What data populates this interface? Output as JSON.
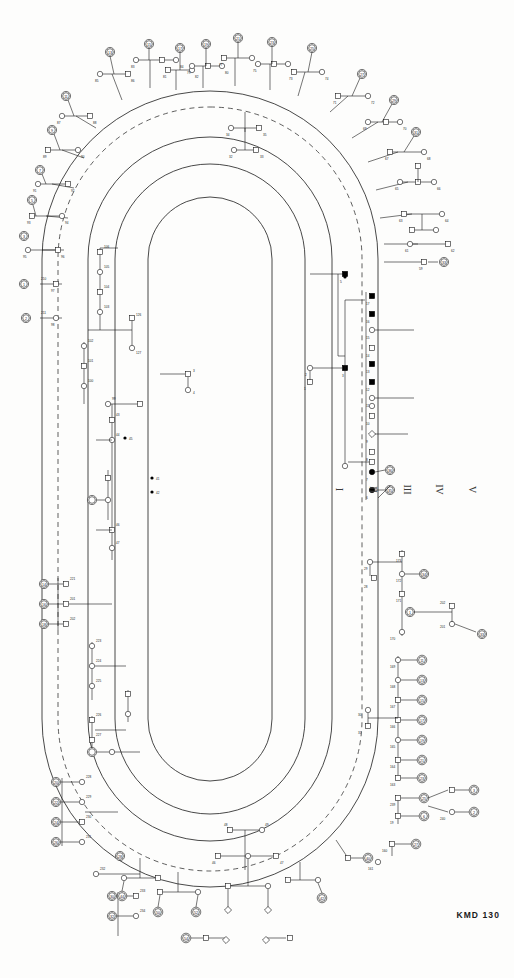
{
  "figure": {
    "identifier": "KMD 130",
    "type": "circular-pedigree-chart",
    "title": "",
    "background_color": "#fdfdfc",
    "line_color": "#1a1a1a",
    "affected_fill": "#000000"
  },
  "generation_legend": {
    "orientation": "rotated-90",
    "labels": [
      "I",
      "II",
      "III",
      "IV",
      "V"
    ],
    "x_positions": [
      338,
      372,
      405,
      437,
      470
    ],
    "y": 492
  },
  "tracks": {
    "description": "Concentric oval generation rings",
    "rings": [
      {
        "name": "outer-solid",
        "rx": 168,
        "ry": 398,
        "dash": "none"
      },
      {
        "name": "generation-dashed",
        "rx": 152,
        "ry": 382,
        "dash": "6 5"
      },
      {
        "name": "mid-solid-outer",
        "rx": 122,
        "ry": 352,
        "dash": "none"
      },
      {
        "name": "mid-solid-inner",
        "rx": 95,
        "ry": 325,
        "dash": "none"
      },
      {
        "name": "inner-solid",
        "rx": 62,
        "ry": 292,
        "dash": "none"
      }
    ],
    "center_x": 210,
    "center_y": 489
  },
  "symbols": {
    "male": "square",
    "female": "circle",
    "unknown_sex": "diamond",
    "affected": "filled-black",
    "unaffected": "open-white",
    "proband_marker": "double-outline-with-number"
  },
  "core_family": {
    "note": "Central affected sibship at right of inner oval",
    "affected_ids": [
      "63",
      "65",
      "39",
      "41",
      "38",
      "40"
    ],
    "members": [
      {
        "id": "37",
        "sex": "male",
        "affected": true
      },
      {
        "id": "36",
        "sex": "female",
        "affected": false
      },
      {
        "id": "68",
        "sex": "male",
        "affected": true
      },
      {
        "id": "69",
        "sex": "male",
        "affected": true
      },
      {
        "id": "63",
        "sex": "female",
        "affected": true
      },
      {
        "id": "65",
        "sex": "female",
        "affected": true
      },
      {
        "id": "61",
        "sex": "male",
        "affected": false
      },
      {
        "id": "67",
        "sex": "male",
        "affected": false
      }
    ]
  },
  "numbered_individuals": {
    "note": "Double-circled individuals carry reference numbers around the outer ring",
    "left_upper": [
      "2",
      "3",
      "4",
      "6",
      "7",
      "8",
      "9",
      "11",
      "12",
      "13"
    ],
    "left_lower": [
      "1",
      "5",
      "14",
      "15",
      "16",
      "17",
      "18",
      "19",
      "20",
      "21"
    ],
    "top": [
      "22",
      "23",
      "24",
      "25",
      "26",
      "27",
      "28",
      "29"
    ],
    "right": [
      "30",
      "31",
      "32",
      "33",
      "34",
      "35"
    ],
    "bottom": [
      "42",
      "43",
      "44",
      "45",
      "46",
      "47",
      "48",
      "49",
      "50"
    ]
  },
  "id_label_ranges": {
    "left_column": "101-133",
    "right_column": "136-170",
    "inner_left": "40-69",
    "inner_right": "180-200",
    "bottom": "70-99"
  }
}
